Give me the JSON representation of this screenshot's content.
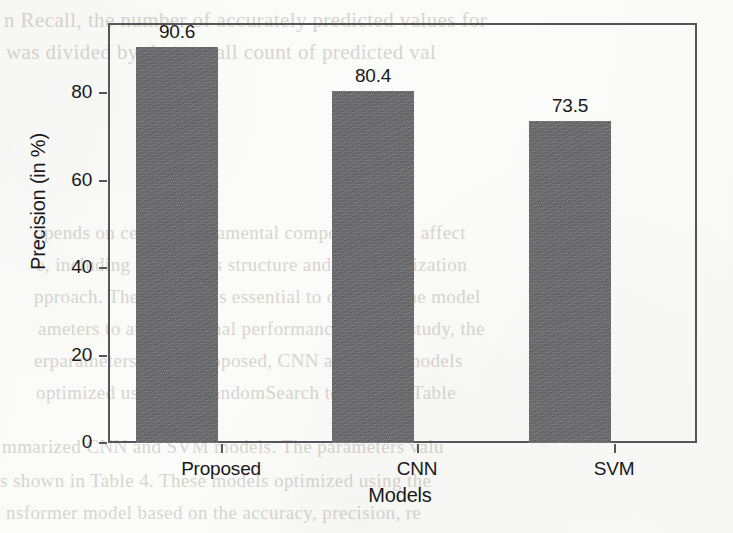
{
  "chart_data": {
    "type": "bar",
    "title": "",
    "categories": [
      "Proposed",
      "CNN",
      "SVM"
    ],
    "values": [
      90.6,
      80.4,
      73.5
    ],
    "value_labels": [
      "90.6",
      "80.4",
      "73.5"
    ],
    "xlabel": "Models",
    "ylabel": "Precision (in %)",
    "ylim": [
      0,
      96
    ],
    "ytick_labels": [
      "0",
      "20",
      "40",
      "60",
      "80"
    ],
    "ytick_values": [
      0,
      20,
      40,
      60,
      80
    ],
    "grid": false,
    "legend": false,
    "bar_color": "#6c6c6e",
    "axis_color": "#56565a",
    "text_color": "#19191b",
    "background_color": "#fcfcfa"
  },
  "bleed_text": {
    "top_line_1": "n Recall, the number of accurately predicted values for",
    "top_line_2": "was divided by the overall count of predicted val",
    "mid_line_1": "ppends on certain fundamental components that affect",
    "mid_line_2": "e, including the models structure and the optimization",
    "mid_line_3": "pproach. Therefore, it is essential to optimize the model",
    "mid_line_4": "ameters to attain optimal performance. In this study, the",
    "mid_line_5": "erparameters of the Proposed, CNN and SVM models",
    "mid_line_6": "optimized using the RandomSearch technique. Table",
    "bottom_line_1": "mmarized CNN and SVM models. The parameters valu",
    "bottom_line_2": "s shown in Table 4. These models optimized using the",
    "bottom_line_3": "nsformer model based on the accuracy, precision, re"
  }
}
